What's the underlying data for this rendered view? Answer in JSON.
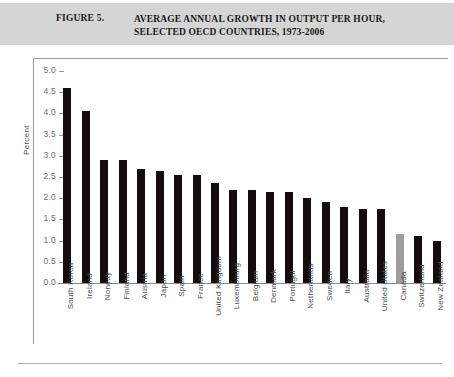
{
  "header": {
    "figure_number": "FIGURE 5.",
    "title": "AVERAGE ANNUAL GROWTH IN OUTPUT PER HOUR, SELECTED OECD COUNTRIES, 1973-2006",
    "band_color": "#d5d5d5"
  },
  "chart_data": {
    "type": "bar",
    "title": "AVERAGE ANNUAL GROWTH IN OUTPUT PER HOUR, SELECTED OECD COUNTRIES, 1973-2006",
    "xlabel": "",
    "ylabel": "Percent",
    "ylim": [
      0.0,
      5.0
    ],
    "ytick_step": 0.5,
    "yticks": [
      "5.0",
      "4.5",
      "4.0",
      "3.5",
      "3.0",
      "2.5",
      "2.0",
      "1.5",
      "1.0",
      "0.5",
      "0.0"
    ],
    "grid": false,
    "legend": "none",
    "bar_color": "#140d0d",
    "highlight_color": "#9d9d9d",
    "highlight_category": "Canada",
    "categories": [
      "South Korea",
      "Ireland",
      "Norway",
      "Finland",
      "Austria",
      "Japan",
      "Spain",
      "France",
      "United Kingdom",
      "Luxembourg",
      "Belgium",
      "Denmark",
      "Portugal",
      "Netherlands",
      "Sweden",
      "Italy",
      "Australia",
      "United States",
      "Canada",
      "Switzerland",
      "New Zealand"
    ],
    "values": [
      4.6,
      4.05,
      2.9,
      2.9,
      2.7,
      2.65,
      2.55,
      2.55,
      2.35,
      2.2,
      2.2,
      2.15,
      2.15,
      2.0,
      1.9,
      1.8,
      1.75,
      1.75,
      1.15,
      1.1,
      1.0
    ]
  }
}
